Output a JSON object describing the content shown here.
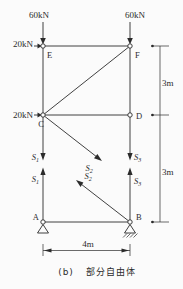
{
  "colors": {
    "line": "#2b2b2b",
    "background": "#fbfbfb"
  },
  "loads": {
    "top_left": "60kN",
    "top_right": "60kN",
    "side_top": "20kN",
    "side_mid": "20kN"
  },
  "nodes": {
    "a": "A",
    "b": "B",
    "c": "C",
    "d": "D",
    "e": "E",
    "f": "F"
  },
  "forces": {
    "s1": {
      "base": "S",
      "sub": "1"
    },
    "s2": {
      "base": "S",
      "sub": "2"
    },
    "s3": {
      "base": "S",
      "sub": "3"
    }
  },
  "dimensions": {
    "height_upper": "3m",
    "height_lower": "3m",
    "width": "4m"
  },
  "caption": {
    "label": "(b)",
    "text": "部分自由体"
  }
}
